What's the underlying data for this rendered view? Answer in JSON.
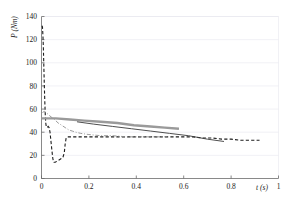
{
  "chart_data": {
    "type": "line",
    "title": "",
    "subtitle": "",
    "xlabel": "t (s)",
    "ylabel": "P (Nm)",
    "xlim": [
      0,
      1
    ],
    "ylim": [
      0,
      140
    ],
    "xticks": [
      0,
      0.2,
      0.4,
      0.6,
      0.8,
      1
    ],
    "xtick_labels": [
      "0",
      "0.2",
      "0.4",
      "0.6",
      "0.8",
      "1"
    ],
    "yticks": [
      0,
      20,
      40,
      60,
      80,
      100,
      120,
      140
    ],
    "ytick_labels": [
      "0",
      "20",
      "40",
      "60",
      "80",
      "100",
      "120",
      "140"
    ],
    "grid": "horizontal",
    "legend": "none",
    "legend_position": "none",
    "background": "#ffffff",
    "grid_color": "#e8e8ee",
    "axis_color": "#6b6b6b",
    "series": [
      {
        "name": "black-dashed-curve",
        "style": "dashed",
        "color": "#1c1c1c",
        "width": 1.1,
        "points": [
          [
            0.002,
            132
          ],
          [
            0.004,
            131
          ],
          [
            0.006,
            124
          ],
          [
            0.008,
            112
          ],
          [
            0.01,
            96
          ],
          [
            0.012,
            80
          ],
          [
            0.014,
            66
          ],
          [
            0.016,
            55
          ],
          [
            0.018,
            48
          ],
          [
            0.02,
            45
          ],
          [
            0.024,
            44
          ],
          [
            0.028,
            45
          ],
          [
            0.032,
            44
          ],
          [
            0.036,
            40
          ],
          [
            0.04,
            32
          ],
          [
            0.044,
            24
          ],
          [
            0.048,
            17
          ],
          [
            0.052,
            14
          ],
          [
            0.058,
            14
          ],
          [
            0.066,
            15
          ],
          [
            0.074,
            16
          ],
          [
            0.082,
            17
          ],
          [
            0.09,
            18
          ],
          [
            0.096,
            22
          ],
          [
            0.1,
            30
          ],
          [
            0.104,
            35
          ],
          [
            0.11,
            36
          ],
          [
            0.13,
            36
          ],
          [
            0.17,
            36
          ],
          [
            0.22,
            36
          ],
          [
            0.28,
            36
          ],
          [
            0.34,
            36
          ],
          [
            0.4,
            36
          ],
          [
            0.46,
            36
          ],
          [
            0.52,
            36
          ],
          [
            0.56,
            36
          ],
          [
            0.6,
            36
          ],
          [
            0.64,
            36
          ],
          [
            0.68,
            35
          ],
          [
            0.72,
            35
          ],
          [
            0.76,
            34
          ],
          [
            0.8,
            34
          ],
          [
            0.84,
            33
          ],
          [
            0.88,
            33
          ],
          [
            0.92,
            33
          ]
        ]
      },
      {
        "name": "gray-thick-line",
        "style": "solid",
        "color": "#9a9a9a",
        "width": 2.4,
        "points": [
          [
            0.0,
            52
          ],
          [
            0.06,
            52
          ],
          [
            0.12,
            51
          ],
          [
            0.18,
            50
          ],
          [
            0.25,
            49
          ],
          [
            0.32,
            48
          ],
          [
            0.39,
            46
          ],
          [
            0.46,
            45
          ],
          [
            0.52,
            44
          ],
          [
            0.58,
            43
          ]
        ]
      },
      {
        "name": "dark-thin-line",
        "style": "solid",
        "color": "#3a3a3a",
        "width": 0.9,
        "points": [
          [
            0.15,
            49
          ],
          [
            0.22,
            47
          ],
          [
            0.3,
            45
          ],
          [
            0.38,
            43
          ],
          [
            0.46,
            41
          ],
          [
            0.54,
            39
          ],
          [
            0.62,
            37
          ],
          [
            0.7,
            34
          ],
          [
            0.77,
            32
          ]
        ]
      },
      {
        "name": "gray-dashdot-curve",
        "style": "dashdot",
        "color": "#8f8f8f",
        "width": 0.9,
        "points": [
          [
            0.004,
            57
          ],
          [
            0.012,
            58
          ],
          [
            0.02,
            57
          ],
          [
            0.03,
            55
          ],
          [
            0.042,
            53
          ],
          [
            0.055,
            51
          ],
          [
            0.07,
            48
          ],
          [
            0.085,
            46
          ],
          [
            0.1,
            44
          ],
          [
            0.115,
            42
          ],
          [
            0.13,
            41
          ],
          [
            0.145,
            40
          ],
          [
            0.165,
            39
          ],
          [
            0.2,
            38
          ],
          [
            0.25,
            37
          ],
          [
            0.3,
            37
          ],
          [
            0.36,
            36
          ],
          [
            0.42,
            36
          ],
          [
            0.48,
            36
          ],
          [
            0.53,
            36
          ]
        ]
      }
    ]
  },
  "axes": {
    "ylabel_text": "P (Nm)",
    "xlabel_text": "t (s)"
  }
}
